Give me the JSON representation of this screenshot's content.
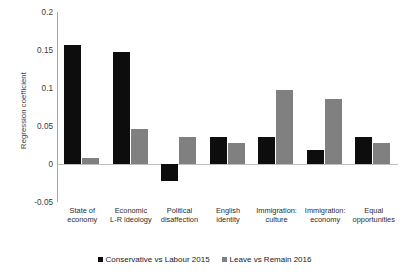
{
  "chart_data": {
    "type": "bar",
    "title": "",
    "xlabel": "",
    "ylabel": "Regression coefficient",
    "ylim": [
      -0.05,
      0.2
    ],
    "yticks": [
      0.2,
      0.15,
      0.1,
      0.05,
      0,
      -0.05
    ],
    "ytick_labels": [
      "0.2",
      "0.15",
      "0.1",
      "0.05",
      "0",
      "-0.05"
    ],
    "grid": false,
    "legend_position": "bottom",
    "categories": [
      "State of economy",
      "Economic L-R ideology",
      "Political disaffection",
      "English identity",
      "Immigration: culture",
      "Immigration: economy",
      "Equal opportunities"
    ],
    "category_lines": [
      [
        "State of",
        "economy"
      ],
      [
        "Economic",
        "L-R ideology"
      ],
      [
        "Political",
        "disaffection"
      ],
      [
        "English",
        "identity"
      ],
      [
        "Immigration:",
        "culture"
      ],
      [
        "Immigration:",
        "economy"
      ],
      [
        "Equal",
        "opportunities"
      ]
    ],
    "series": [
      {
        "name": "Conservative vs Labour 2015",
        "color": "#0d0d0d",
        "values": [
          0.157,
          0.148,
          -0.022,
          0.036,
          0.036,
          0.018,
          0.035
        ]
      },
      {
        "name": "Leave vs Remain 2016",
        "color": "#808080",
        "values": [
          0.008,
          0.046,
          0.036,
          0.027,
          0.097,
          0.086,
          0.027
        ]
      }
    ]
  }
}
